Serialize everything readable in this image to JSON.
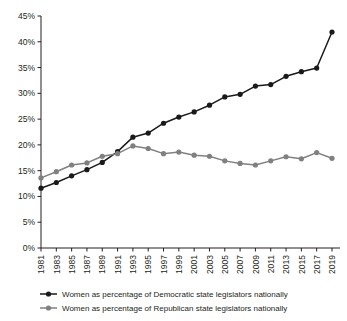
{
  "chart_data": {
    "type": "line",
    "title": "",
    "subtitle": "",
    "xlabel": "",
    "ylabel": "",
    "x": [
      1981,
      1983,
      1985,
      1987,
      1989,
      1991,
      1993,
      1995,
      1997,
      1999,
      2001,
      2003,
      2005,
      2007,
      2009,
      2011,
      2013,
      2015,
      2017,
      2019
    ],
    "xticklabels": [
      "1981",
      "1983",
      "1985",
      "1987",
      "1989",
      "1991",
      "1993",
      "1995",
      "1997",
      "1999",
      "2001",
      "2003",
      "2005",
      "2007",
      "2009",
      "2011",
      "2013",
      "2015",
      "2017",
      "2019"
    ],
    "yticklabels": [
      "0%",
      "5%",
      "10%",
      "15%",
      "20%",
      "25%",
      "30%",
      "35%",
      "40%",
      "45%"
    ],
    "yticks": [
      0,
      5,
      10,
      15,
      20,
      25,
      30,
      35,
      40,
      45
    ],
    "ylim": [
      0,
      45
    ],
    "xlim": [
      1981,
      2019
    ],
    "grid": false,
    "legend_position": "bottom",
    "series": [
      {
        "name": "Women as percentage of Democratic state legislators nationally",
        "color": "#1a1a1a",
        "marker": "circle",
        "values": [
          11.6,
          12.7,
          14.0,
          15.2,
          16.6,
          18.7,
          21.5,
          22.3,
          24.2,
          25.4,
          26.4,
          27.7,
          29.3,
          29.8,
          31.4,
          31.7,
          33.3,
          34.2,
          34.9,
          41.9
        ]
      },
      {
        "name": "Women as percentage of Republican state legislators nationally",
        "color": "#808080",
        "marker": "circle",
        "values": [
          13.6,
          14.8,
          16.1,
          16.5,
          17.8,
          18.3,
          19.8,
          19.3,
          18.3,
          18.6,
          18.0,
          17.8,
          16.9,
          16.4,
          16.1,
          16.9,
          17.7,
          17.3,
          18.5,
          17.4
        ]
      }
    ]
  },
  "legend": {
    "items": [
      {
        "label": "Women as percentage of Democratic state legislators nationally",
        "color": "#1a1a1a"
      },
      {
        "label": "Women as percentage of Republican state legislators nationally",
        "color": "#808080"
      }
    ]
  }
}
